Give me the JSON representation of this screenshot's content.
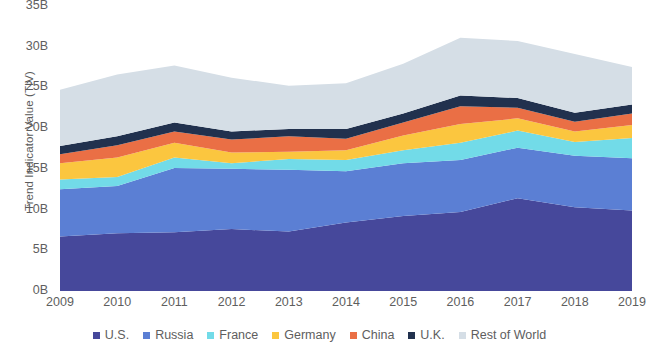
{
  "chart_data": {
    "type": "area",
    "stacked": true,
    "title": "",
    "subtitle": "",
    "xlabel": "",
    "ylabel": "Trend Indicator Value (TIV)",
    "categories": [
      "2009",
      "2010",
      "2011",
      "2012",
      "2013",
      "2014",
      "2015",
      "2016",
      "2017",
      "2018",
      "2019"
    ],
    "x": [
      2009,
      2010,
      2011,
      2012,
      2013,
      2014,
      2015,
      2016,
      2017,
      2018,
      2019
    ],
    "xlim": [
      2009,
      2019
    ],
    "ylim": [
      0,
      35
    ],
    "y_ticks": [
      0,
      5,
      10,
      15,
      20,
      25,
      30,
      35
    ],
    "y_tick_labels": [
      "0B",
      "5B",
      "10B",
      "15B",
      "20B",
      "25B",
      "30B",
      "35B"
    ],
    "units": "billions (B) of TIV",
    "grid": false,
    "legend_position": "bottom",
    "series": [
      {
        "name": "U.S.",
        "color": "#46489b",
        "values": [
          6.7,
          7.1,
          7.2,
          7.6,
          7.3,
          8.4,
          9.2,
          9.7,
          11.4,
          10.3,
          9.9
        ]
      },
      {
        "name": "Russia",
        "color": "#5b7fd4",
        "values": [
          5.8,
          5.8,
          7.9,
          7.4,
          7.6,
          6.3,
          6.5,
          6.4,
          6.2,
          6.3,
          6.4
        ]
      },
      {
        "name": "France",
        "color": "#72dbe8",
        "values": [
          1.2,
          1.1,
          1.3,
          0.7,
          1.3,
          1.4,
          1.6,
          2.1,
          2.1,
          1.7,
          2.5
        ]
      },
      {
        "name": "Germany",
        "color": "#fbc63f",
        "values": [
          2.0,
          2.4,
          1.8,
          1.3,
          0.9,
          1.2,
          1.8,
          2.3,
          1.5,
          1.3,
          1.6
        ]
      },
      {
        "name": "China",
        "color": "#ea6f45",
        "values": [
          1.1,
          1.5,
          1.4,
          1.6,
          1.9,
          1.4,
          1.6,
          2.2,
          1.3,
          1.2,
          1.4
        ]
      },
      {
        "name": "U.K.",
        "color": "#21314e",
        "values": [
          1.0,
          1.1,
          1.1,
          1.0,
          0.9,
          1.2,
          1.1,
          1.3,
          1.2,
          1.1,
          1.1
        ]
      },
      {
        "name": "Rest of World",
        "color": "#d5dee6",
        "values": [
          6.9,
          7.6,
          7.0,
          6.6,
          5.3,
          5.6,
          6.1,
          7.1,
          7.0,
          7.2,
          4.6
        ]
      }
    ],
    "totals": [
      24.7,
      26.6,
      27.7,
      26.2,
      25.2,
      25.5,
      27.9,
      31.1,
      30.7,
      29.1,
      27.5
    ]
  },
  "legend": {
    "items": [
      {
        "label": "U.S."
      },
      {
        "label": "Russia"
      },
      {
        "label": "France"
      },
      {
        "label": "Germany"
      },
      {
        "label": "China"
      },
      {
        "label": "U.K."
      },
      {
        "label": "Rest of World"
      }
    ]
  }
}
